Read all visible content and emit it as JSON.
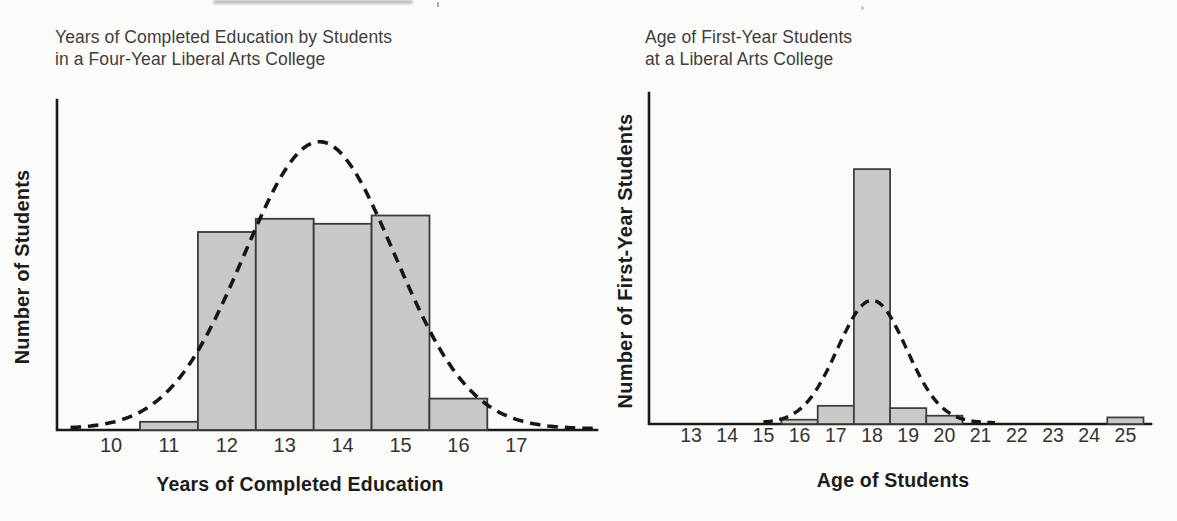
{
  "page": {
    "background": "#fbfbfa"
  },
  "chart_data": [
    {
      "type": "bar",
      "variant": "histogram-with-normal-curve-overlay",
      "title": "Years of Completed Education by Students\nin a Four-Year Liberal Arts College",
      "xlabel": "Years of Completed Education",
      "ylabel": "Number of Students",
      "x_ticks": [
        10,
        11,
        12,
        13,
        14,
        15,
        16,
        17
      ],
      "y_ticks": [],
      "y_scale_note": "y-axis unlabeled; bar heights given as fraction of y-axis height",
      "bars": [
        {
          "x": 11,
          "h": 0.025
        },
        {
          "x": 12,
          "h": 0.6
        },
        {
          "x": 13,
          "h": 0.64
        },
        {
          "x": 14,
          "h": 0.625
        },
        {
          "x": 15,
          "h": 0.65
        },
        {
          "x": 16,
          "h": 0.095
        }
      ],
      "normal_curve": {
        "style": "dashed",
        "mean": 13.6,
        "sd": 1.3,
        "peak_h": 0.87,
        "x_range": [
          9.3,
          18.4
        ]
      },
      "grid": false,
      "bar_width_units": 1,
      "colors": {
        "bar_fill": "#c8c8c6",
        "bar_stroke": "#3a3a3a",
        "curve": "#161616",
        "axis": "#1a1a1a",
        "tick_text": "#333333",
        "title_text": "#3e3e3e",
        "label_text": "#1c1c1c"
      }
    },
    {
      "type": "bar",
      "variant": "histogram-with-normal-curve-overlay",
      "title": "Age of First-Year Students\nat a Liberal Arts College",
      "xlabel": "Age of Students",
      "ylabel": "Number of First-Year Students",
      "x_ticks": [
        13,
        14,
        15,
        16,
        17,
        18,
        19,
        20,
        21,
        22,
        23,
        24,
        25
      ],
      "y_ticks": [],
      "y_scale_note": "y-axis unlabeled; bar heights given as fraction of y-axis height",
      "bars": [
        {
          "x": 16,
          "h": 0.013
        },
        {
          "x": 17,
          "h": 0.055
        },
        {
          "x": 18,
          "h": 0.77
        },
        {
          "x": 19,
          "h": 0.048
        },
        {
          "x": 20,
          "h": 0.025
        },
        {
          "x": 25,
          "h": 0.02
        }
      ],
      "normal_curve": {
        "style": "dashed",
        "mean": 18,
        "sd": 0.95,
        "peak_h": 0.37,
        "x_range": [
          15.0,
          21.4
        ]
      },
      "grid": false,
      "bar_width_units": 1,
      "colors": {
        "bar_fill": "#c8c8c6",
        "bar_stroke": "#3a3a3a",
        "curve": "#161616",
        "axis": "#1a1a1a",
        "tick_text": "#333333",
        "title_text": "#3e3e3e",
        "label_text": "#1c1c1c"
      }
    }
  ]
}
